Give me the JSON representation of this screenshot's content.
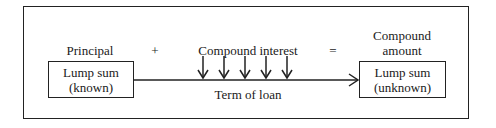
{
  "diagram": {
    "labels": {
      "principal": "Principal",
      "plus": "+",
      "compound_interest": "Compound interest",
      "equals": "=",
      "compound_amount_line1": "Compound",
      "compound_amount_line2": "amount",
      "term": "Term of loan"
    },
    "left_box": {
      "line1": "Lump sum",
      "line2": "(known)"
    },
    "right_box": {
      "line1": "Lump sum",
      "line2": "(unknown)"
    },
    "interest_arrows": 5,
    "colors": {
      "stroke": "#222222",
      "background": "#ffffff"
    }
  }
}
